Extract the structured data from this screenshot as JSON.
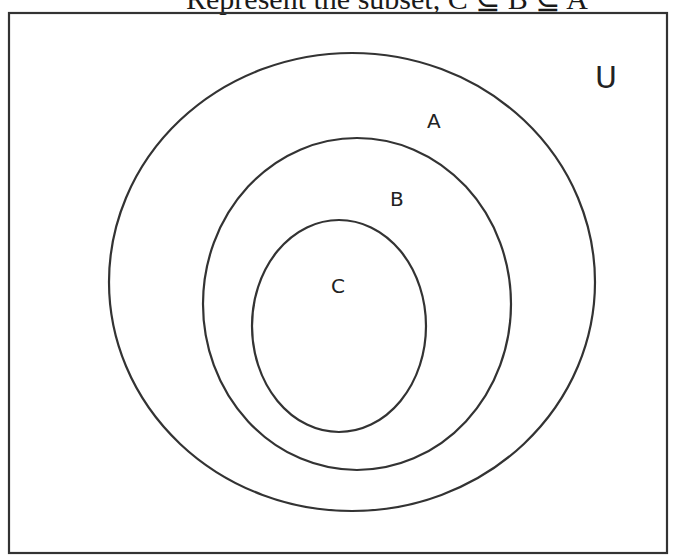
{
  "title": {
    "text": "Represent the subset, C ⊆ B ⊆ A"
  },
  "diagram": {
    "type": "venn-nested-subsets",
    "stroke_color": "#333333",
    "universe": {
      "label": "U",
      "x": 9,
      "y": 13,
      "width": 658,
      "height": 540
    },
    "sets": [
      {
        "label": "A",
        "cx": 352,
        "cy": 282,
        "rx": 243,
        "ry": 229
      },
      {
        "label": "B",
        "cx": 357,
        "cy": 304,
        "rx": 154,
        "ry": 166
      },
      {
        "label": "C",
        "cx": 339,
        "cy": 326,
        "rx": 87,
        "ry": 106
      }
    ],
    "labels": {
      "u": "U",
      "a": "A",
      "b": "B",
      "c": "C"
    }
  }
}
